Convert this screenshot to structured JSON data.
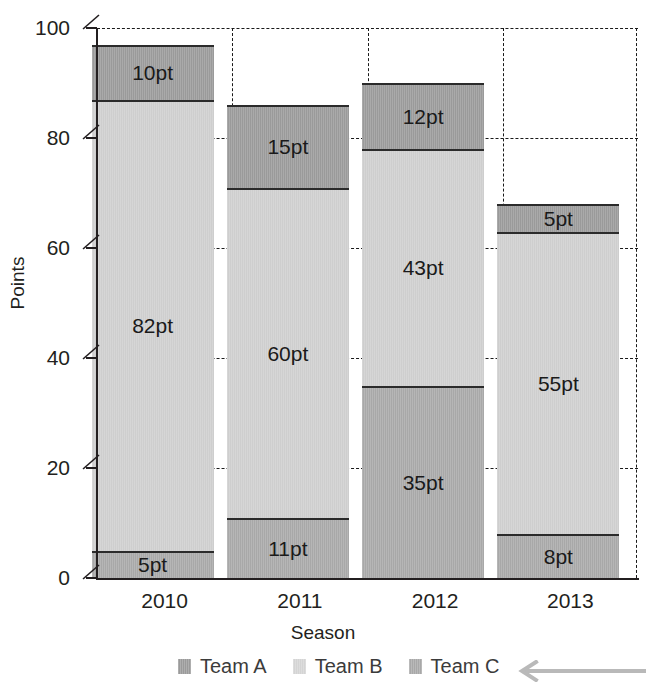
{
  "chart_data": {
    "type": "bar",
    "subtype": "stacked-bar",
    "title": "",
    "xlabel": "Season",
    "ylabel": "Points",
    "categories": [
      "2010",
      "2011",
      "2012",
      "2013"
    ],
    "series": [
      {
        "name": "Team C",
        "values": [
          5,
          11,
          35,
          8
        ],
        "color": "#a8a8a8",
        "stack_position": "bottom"
      },
      {
        "name": "Team B",
        "values": [
          82,
          60,
          43,
          55
        ],
        "color": "#cecece",
        "stack_position": "middle"
      },
      {
        "name": "Team A",
        "values": [
          10,
          15,
          12,
          5
        ],
        "color": "#9a9a9a",
        "stack_position": "top"
      }
    ],
    "totals": [
      97,
      86,
      90,
      68
    ],
    "value_label_suffix": "pt",
    "bar_labels": [
      {
        "category": "2010",
        "bottom": "5pt",
        "middle": "82pt",
        "top": "10pt"
      },
      {
        "category": "2011",
        "bottom": "11pt",
        "middle": "60pt",
        "top": "15pt"
      },
      {
        "category": "2012",
        "bottom": "35pt",
        "middle": "43pt",
        "top": "12pt"
      },
      {
        "category": "2013",
        "bottom": "8pt",
        "middle": "55pt",
        "top": "5pt"
      }
    ],
    "ylim": [
      0,
      100
    ],
    "yticks": [
      0,
      20,
      40,
      60,
      80,
      100
    ],
    "ytick_labels": [
      "0",
      "20",
      "40",
      "60",
      "80",
      "100"
    ],
    "grid": {
      "horizontal": true,
      "vertical": true,
      "style": "dashed"
    },
    "legend": {
      "position": "bottom",
      "entries": [
        "Team A",
        "Team B",
        "Team C"
      ]
    },
    "annotations": [
      {
        "kind": "arrow",
        "direction": "left",
        "color": "#b8b8b8",
        "target": "Team C"
      }
    ]
  },
  "axes": {
    "y_title": "Points",
    "x_title": "Season",
    "y_tick_labels": [
      "100",
      "80",
      "60",
      "40",
      "20",
      "0"
    ],
    "x_tick_labels": [
      "2010",
      "2011",
      "2012",
      "2013"
    ]
  },
  "legend": {
    "items": [
      {
        "label": "Team A",
        "swatch": "teamA"
      },
      {
        "label": "Team B",
        "swatch": "teamB"
      },
      {
        "label": "Team C",
        "swatch": "teamC"
      }
    ]
  },
  "icons": {
    "annotation_arrow": "arrow-left-icon"
  }
}
